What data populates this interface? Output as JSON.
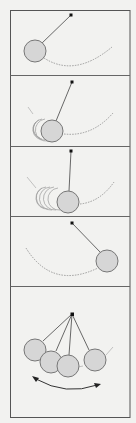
{
  "figure": {
    "title": "",
    "colors": {
      "background": "#f2f2f0",
      "frame": "#555555",
      "bob_fill": "#d6d6d6",
      "bob_stroke": "#777777",
      "pivot": "#111111",
      "arc": "#888888"
    },
    "panels": [
      {
        "id": 1,
        "label": "",
        "state": "bob raised to left"
      },
      {
        "id": 2,
        "label": "",
        "state": "bob swinging down-left with motion blur"
      },
      {
        "id": 3,
        "label": "",
        "state": "bob at bottom with motion blur"
      },
      {
        "id": 4,
        "label": "",
        "state": "bob raised to right"
      },
      {
        "id": 5,
        "label": "",
        "state": "composite of positions with double-headed swing arrow"
      }
    ]
  }
}
